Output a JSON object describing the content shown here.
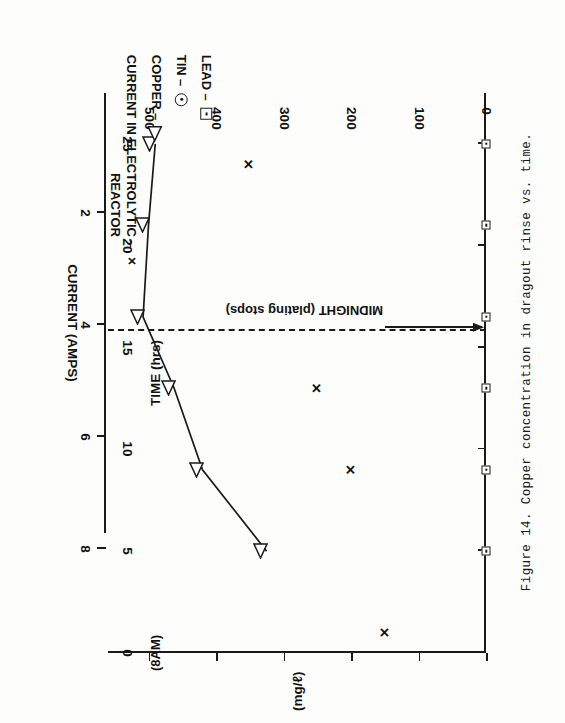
{
  "caption": "Figure 14.  Copper concentration in dragout rinse vs. time.",
  "axes": {
    "y": {
      "title": "(mg/ℓ)",
      "ticks": [
        0,
        100,
        200,
        300,
        400,
        500
      ],
      "min": 0,
      "max": 560
    },
    "x": {
      "title": "TIME (hrs)",
      "ticks": [
        0,
        5,
        10,
        15,
        20,
        25
      ],
      "min": 0,
      "max": 27.5,
      "origin_note": "(8AM)"
    },
    "current": {
      "title": "CURRENT (AMPS)",
      "ticks": [
        2,
        4,
        6,
        8
      ],
      "min": 0,
      "max": 10
    }
  },
  "legend": {
    "items": [
      {
        "symbol": "x-marker",
        "dash": "–",
        "label": "CURRENT IN ELECTROLYTIC\nREACTOR"
      },
      {
        "symbol": "triangle-marker",
        "dash": "–",
        "label": "COPPER"
      },
      {
        "symbol": "circle-marker",
        "dash": "–",
        "label": "TIN"
      },
      {
        "symbol": "square-marker",
        "dash": "–",
        "label": "LEAD"
      }
    ]
  },
  "annotation": {
    "midnight_label": "MIDNIGHT (plating stops)",
    "midnight_time": 16.0
  },
  "chart_data": {
    "type": "line",
    "title": "Copper concentration in dragout rinse vs. time",
    "xlabel": "TIME (hrs)",
    "ylabel": "(mg/ℓ)",
    "xlim": [
      0,
      27.5
    ],
    "ylim": [
      0,
      560
    ],
    "y2label": "CURRENT (AMPS)",
    "y2lim": [
      0,
      10
    ],
    "grid": false,
    "legend_position": "top-right",
    "series": [
      {
        "name": "COPPER",
        "marker": "triangle",
        "connected": true,
        "axis": "left",
        "x": [
          5,
          9,
          13,
          16.5,
          21,
          25
        ],
        "y": [
          325,
          420,
          462,
          508,
          500,
          490
        ]
      },
      {
        "name": "CURRENT IN ELECTROLYTIC REACTOR",
        "marker": "x",
        "connected": false,
        "axis": "right",
        "x": [
          1,
          9,
          13,
          24
        ],
        "y": [
          2.7,
          3.6,
          4.5,
          6.3
        ]
      },
      {
        "name": "LEAD",
        "marker": "square",
        "connected": false,
        "axis": "left",
        "x": [
          5,
          9,
          13,
          16.5,
          21,
          25
        ],
        "y": [
          0,
          0,
          0,
          0,
          0,
          0
        ]
      },
      {
        "name": "TIN",
        "marker": "circle",
        "connected": false,
        "axis": "left",
        "x": [],
        "y": []
      }
    ]
  }
}
